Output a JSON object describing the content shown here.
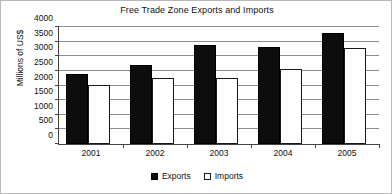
{
  "chart_data": {
    "type": "bar",
    "title": "Free Trade Zone Exports and Imports",
    "xlabel": "",
    "ylabel": "Millions of US$",
    "categories": [
      "2001",
      "2002",
      "2003",
      "2004",
      "2005"
    ],
    "series": [
      {
        "name": "Exports",
        "color": "#0d0d0d",
        "values": [
          2400,
          2700,
          3380,
          3330,
          3800
        ]
      },
      {
        "name": "Imports",
        "color": "#ffffff",
        "values": [
          2020,
          2250,
          2260,
          2570,
          3280
        ]
      }
    ],
    "ylim": [
      0,
      4000
    ],
    "ytick_step": 500,
    "yticks": [
      4000,
      3500,
      3000,
      2500,
      2000,
      1500,
      1000,
      500,
      0
    ],
    "ytick_labels": [
      "4000",
      "3500",
      "3000",
      "2500",
      "2000",
      "1500",
      "1000",
      "500",
      "0"
    ],
    "grid": true,
    "grid_axis": "y",
    "legend_position": "bottom",
    "legend_entries": [
      {
        "label": "Exports",
        "swatch": "filled-square"
      },
      {
        "label": "Imports",
        "swatch": "outlined-square"
      }
    ]
  }
}
